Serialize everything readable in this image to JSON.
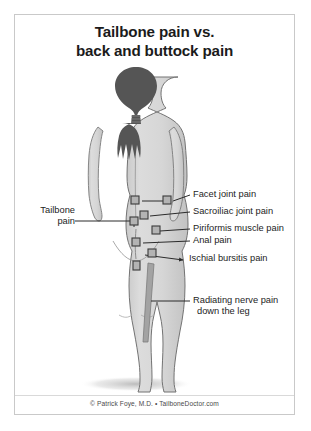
{
  "poster": {
    "title_line1": "Tailbone pain vs.",
    "title_line2": "back and buttock pain",
    "footer": "© Patrick Foye, M.D. • TailboneDoctor.com",
    "background_color": "#ffffff",
    "border_color": "#c9c9c9",
    "text_color": "#1d1d1d"
  },
  "figure": {
    "skin_color": "#d7d7d7",
    "skin_shadow_color": "#bfbfbf",
    "outline_color": "#6e6e6e",
    "hair_color": "#555555",
    "floor_shadow_color": "#c4c4c4",
    "marker_fill": "#b3b3b3",
    "marker_stroke": "#3a3a3a",
    "leader_color": "#2b2b2b",
    "nerve_bar_color": "#9a9a9a"
  },
  "labels": [
    {
      "id": "tailbone",
      "text_line1": "Tailbone",
      "text_line2": "pain",
      "side": "left",
      "x": 18,
      "y": 196
    },
    {
      "id": "facet-joint",
      "text_line1": "Facet joint pain",
      "side": "right",
      "x": 155,
      "y": 175
    },
    {
      "id": "sacroiliac-joint",
      "text_line1": "Sacroiliac joint pain",
      "side": "right",
      "x": 155,
      "y": 192
    },
    {
      "id": "piriformis",
      "text_line1": "Piriformis muscle pain",
      "side": "right",
      "x": 155,
      "y": 209
    },
    {
      "id": "anal",
      "text_line1": "Anal pain",
      "side": "right",
      "x": 155,
      "y": 222
    },
    {
      "id": "ischial-bursitis",
      "text_line1": "Ischial bursitis pain",
      "side": "right",
      "x": 155,
      "y": 239
    },
    {
      "id": "radiating-nerve",
      "text_line1": "Radiating nerve pain",
      "text_line2": "down the leg",
      "side": "right",
      "x": 155,
      "y": 281
    }
  ],
  "markers": [
    {
      "id": "marker-facet-left",
      "x": 121,
      "y": 182
    },
    {
      "id": "marker-facet-right",
      "x": 152,
      "y": 182
    },
    {
      "id": "marker-sacroiliac",
      "x": 129,
      "y": 197
    },
    {
      "id": "marker-piriformis",
      "x": 139,
      "y": 212
    },
    {
      "id": "marker-tailbone",
      "x": 119,
      "y": 212
    },
    {
      "id": "marker-anal",
      "x": 122,
      "y": 224
    },
    {
      "id": "marker-ischial",
      "x": 137,
      "y": 233
    },
    {
      "id": "marker-lower-midline",
      "x": 124,
      "y": 243
    }
  ]
}
